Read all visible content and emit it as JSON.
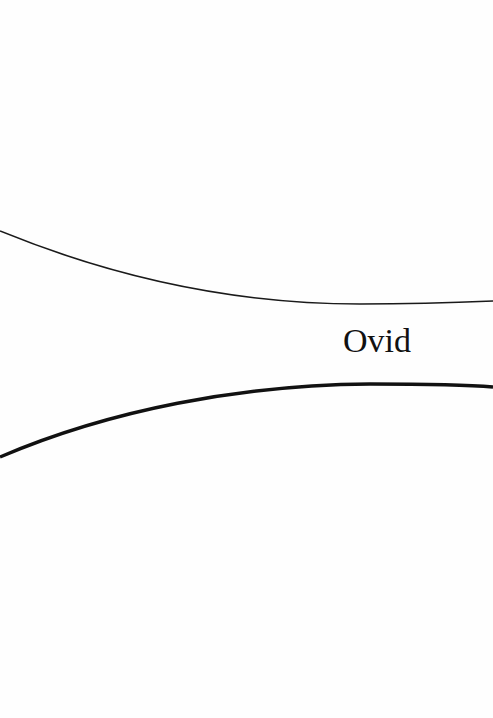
{
  "cover": {
    "author": "Ovid",
    "background_color": "#fefefe",
    "line_color": "#111111"
  }
}
